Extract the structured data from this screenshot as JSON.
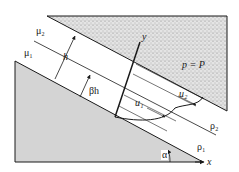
{
  "figure": {
    "type": "two-layer fluid flow down an inclined plane",
    "colors": {
      "line": "#1a1a1a",
      "lower_solid_fill": "#d4d4d4",
      "upper_stipple_fill": "#e4e4e4",
      "stipple_dot": "#6a6a6a"
    },
    "labels": {
      "mu2": "μ₂",
      "mu1": "μ₁",
      "h": "h",
      "beta_h": "βh",
      "y_axis": "y",
      "x_axis": "x",
      "pressure": "p = P",
      "u1": "u₁",
      "u2": "u₂",
      "rho2": "ρ₂",
      "rho1": "ρ₁",
      "alpha": "α"
    }
  }
}
